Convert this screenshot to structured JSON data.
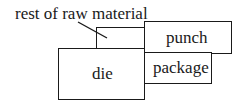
{
  "diagram": {
    "callout": {
      "label": "rest of raw material"
    },
    "boxes": {
      "raw_material": {
        "label": ""
      },
      "punch": {
        "label": "punch"
      },
      "package": {
        "label": "package"
      },
      "die": {
        "label": "die"
      }
    },
    "colors": {
      "stroke": "#1a1a1a",
      "background": "#ffffff"
    }
  }
}
